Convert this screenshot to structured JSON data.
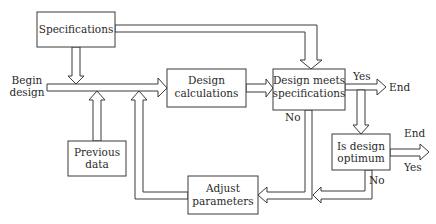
{
  "diagram": {
    "type": "flowchart",
    "title": "",
    "nodes": {
      "specifications": {
        "line1": "Specifications"
      },
      "design_calculations": {
        "line1": "Design",
        "line2": "calculations"
      },
      "design_meets_specs": {
        "line1": "Design meets",
        "line2": "specifications"
      },
      "previous_data": {
        "line1": "Previous",
        "line2": "data"
      },
      "adjust_parameters": {
        "line1": "Adjust",
        "line2": "parameters"
      },
      "is_design_optimum": {
        "line1": "Is design",
        "line2": "optimum"
      }
    },
    "labels": {
      "begin_line1": "Begin",
      "begin_line2": "design",
      "meets_yes": "Yes",
      "meets_end": "End",
      "meets_no": "No",
      "optimum_end": "End",
      "optimum_yes": "Yes",
      "optimum_no": "No"
    },
    "edges": [
      {
        "from": "Begin design",
        "to": "Design calculations"
      },
      {
        "from": "Specifications",
        "to": "Begin design line"
      },
      {
        "from": "Specifications",
        "to": "Design meets specifications"
      },
      {
        "from": "Previous data",
        "to": "Begin design line"
      },
      {
        "from": "Design calculations",
        "to": "Design meets specifications"
      },
      {
        "from": "Design meets specifications",
        "to": "End",
        "label": "Yes"
      },
      {
        "from": "Design meets specifications",
        "to": "Is design optimum",
        "label": "Yes"
      },
      {
        "from": "Design meets specifications",
        "to": "Adjust parameters",
        "label": "No"
      },
      {
        "from": "Is design optimum",
        "to": "End",
        "label": "Yes"
      },
      {
        "from": "Is design optimum",
        "to": "Adjust parameters",
        "label": "No"
      },
      {
        "from": "Adjust parameters",
        "to": "Begin design line"
      }
    ]
  }
}
